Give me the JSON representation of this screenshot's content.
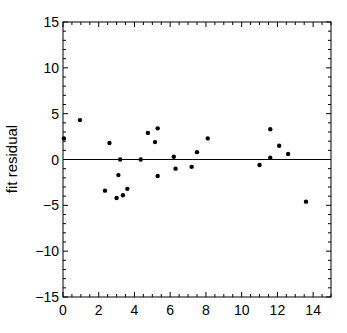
{
  "chart_data": {
    "type": "scatter",
    "title": "",
    "xlabel": "",
    "ylabel": "fit residual",
    "xlim": [
      0,
      15
    ],
    "ylim": [
      -15,
      15
    ],
    "grid": false,
    "legend": null,
    "x_ticks": [
      0,
      2,
      4,
      6,
      8,
      10,
      12,
      14
    ],
    "x_tick_labels": [
      "0",
      "2",
      "4",
      "6",
      "8",
      "10",
      "12",
      "14"
    ],
    "y_ticks": [
      -15,
      -10,
      -5,
      0,
      5,
      10,
      15
    ],
    "y_tick_labels": [
      "−15",
      "−10",
      "−5",
      "0",
      "5",
      "10",
      "15"
    ],
    "reference_line": {
      "y": 0,
      "color": "#000000"
    },
    "series": [
      {
        "name": "residuals",
        "color": "#000000",
        "points": [
          {
            "x": 0.05,
            "y": 2.3
          },
          {
            "x": 0.95,
            "y": 4.3
          },
          {
            "x": 2.35,
            "y": -3.4
          },
          {
            "x": 2.6,
            "y": 1.8
          },
          {
            "x": 3.0,
            "y": -4.2
          },
          {
            "x": 3.1,
            "y": -1.7
          },
          {
            "x": 3.2,
            "y": 0.0
          },
          {
            "x": 3.35,
            "y": -3.9
          },
          {
            "x": 3.6,
            "y": -3.2
          },
          {
            "x": 4.35,
            "y": 0.0
          },
          {
            "x": 4.75,
            "y": 2.9
          },
          {
            "x": 5.15,
            "y": 1.9
          },
          {
            "x": 5.3,
            "y": 3.4
          },
          {
            "x": 5.3,
            "y": -1.8
          },
          {
            "x": 6.2,
            "y": 0.3
          },
          {
            "x": 6.3,
            "y": -1.0
          },
          {
            "x": 7.2,
            "y": -0.8
          },
          {
            "x": 7.5,
            "y": 0.8
          },
          {
            "x": 8.1,
            "y": 2.3
          },
          {
            "x": 11.0,
            "y": -0.6
          },
          {
            "x": 11.6,
            "y": 3.3
          },
          {
            "x": 11.6,
            "y": 0.2
          },
          {
            "x": 12.1,
            "y": 1.5
          },
          {
            "x": 12.6,
            "y": 0.6
          },
          {
            "x": 13.6,
            "y": -4.6
          }
        ]
      }
    ]
  }
}
